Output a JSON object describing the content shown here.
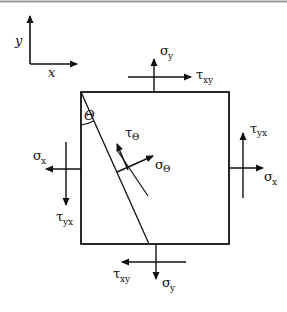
{
  "diagram": {
    "type": "stress-element",
    "colors": {
      "line": "#111111",
      "background": "#ffffff",
      "top_rule": "#9a9a9a"
    },
    "axes": {
      "x_label": "x",
      "y_label": "y"
    },
    "labels": {
      "sigma_y_top": {
        "symbol": "σ",
        "sub": "y"
      },
      "tau_xy_top": {
        "symbol": "τ",
        "sub": "xy"
      },
      "sigma_x_left": {
        "symbol": "σ",
        "sub": "x"
      },
      "tau_yx_left": {
        "symbol": "τ",
        "sub": "yx"
      },
      "tau_yx_right": {
        "symbol": "τ",
        "sub": "yx"
      },
      "sigma_x_right": {
        "symbol": "σ",
        "sub": "x"
      },
      "tau_xy_bottom": {
        "symbol": "τ",
        "sub": "xy"
      },
      "sigma_y_bottom": {
        "symbol": "σ",
        "sub": "y"
      },
      "tau_theta": {
        "symbol": "τ",
        "sub": "Θ"
      },
      "sigma_theta": {
        "symbol": "σ",
        "sub": "Θ"
      },
      "theta_angle": "Θ"
    }
  }
}
